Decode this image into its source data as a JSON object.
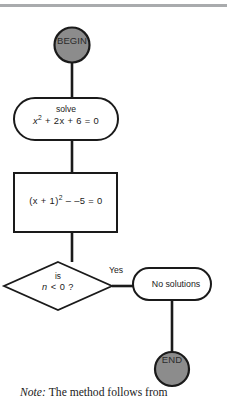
{
  "figure": {
    "type": "flowchart",
    "orientation": "vertical",
    "top_rule_color": "#a9abad",
    "terminal_fill": "#8c8c8c",
    "stroke_color": "#1a1a1a",
    "background": "#ffffff"
  },
  "nodes": {
    "begin": {
      "shape": "circle",
      "label": "BEGIN",
      "fill": "#8c8c8c"
    },
    "solve": {
      "shape": "stadium",
      "line1": "solve",
      "equation": {
        "lhs_base": "x",
        "lhs_exponent": "2",
        "rest": " + 2x + 6 = 0",
        "plain": "x2 + 2x + 6 = 0"
      }
    },
    "completed_square": {
      "shape": "rectangle",
      "equation": {
        "prefix": "(x + 1)",
        "exponent": "2",
        "rest": " – –5 = 0",
        "plain": "(x + 1)2 - -5 = 0"
      }
    },
    "decision": {
      "shape": "diamond",
      "line1": "is",
      "condition": {
        "variable": "n",
        "rest": " < 0 ?",
        "plain": "n < 0 ?"
      }
    },
    "no_solutions": {
      "shape": "stadium",
      "label": "No solutions"
    },
    "end": {
      "shape": "circle",
      "label": "END",
      "fill": "#8c8c8c"
    }
  },
  "edges": [
    {
      "from": "begin",
      "to": "solve",
      "label": ""
    },
    {
      "from": "solve",
      "to": "completed_square",
      "label": ""
    },
    {
      "from": "completed_square",
      "to": "decision",
      "label": ""
    },
    {
      "from": "decision",
      "to": "no_solutions",
      "label": "Yes"
    },
    {
      "from": "no_solutions",
      "to": "end",
      "label": ""
    }
  ],
  "edge_labels": {
    "yes": "Yes"
  },
  "note": {
    "keyword": "Note:",
    "text": "The method follows from"
  }
}
